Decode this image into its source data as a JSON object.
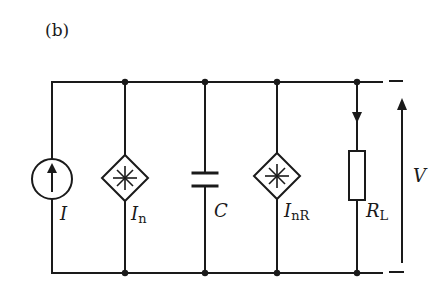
{
  "figure": {
    "panel_label": "(b)",
    "type": "equivalent circuit",
    "stroke_color": "#1a1a1a",
    "background": "#ffffff"
  },
  "components": {
    "current_source": {
      "symbol": "I",
      "kind": "current source (arrow up)"
    },
    "noise_source_1": {
      "symbol": "I",
      "subscript": "n",
      "kind": "noise current source"
    },
    "capacitor": {
      "symbol": "C",
      "kind": "capacitor"
    },
    "noise_source_2": {
      "symbol": "I",
      "subscript": "nR",
      "kind": "resistor noise current source"
    },
    "load_resistor": {
      "symbol": "R",
      "subscript": "L",
      "kind": "load resistor"
    },
    "voltage": {
      "symbol": "V",
      "kind": "output voltage arrow"
    }
  }
}
